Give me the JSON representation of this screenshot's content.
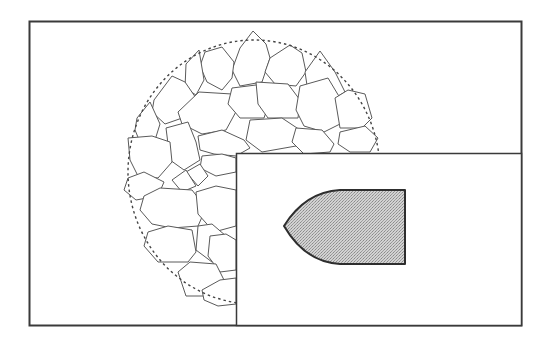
{
  "diagram": {
    "colors": {
      "background": "#ffffff",
      "frame_stroke": "#3a3a3a",
      "fragment_stroke": "#555555",
      "boundary_dash": "#444444",
      "projectile_fill": "#c8c8c8",
      "projectile_stroke": "#2e2e2e"
    },
    "outer_frame": {
      "x": 29,
      "y": 21,
      "width": 493,
      "height": 305
    },
    "inset_panel": {
      "x": 236,
      "y": 153,
      "width": 286,
      "height": 173
    },
    "boundary_circle": {
      "cx": 254,
      "cy": 172,
      "rx": 126,
      "ry": 132,
      "style": "dashed"
    },
    "projectile": {
      "shape": "ogive-nosed cylinder",
      "tip": [
        284,
        225
      ],
      "right_edge_x": 405,
      "top_y": 190,
      "bottom_y": 264
    }
  }
}
